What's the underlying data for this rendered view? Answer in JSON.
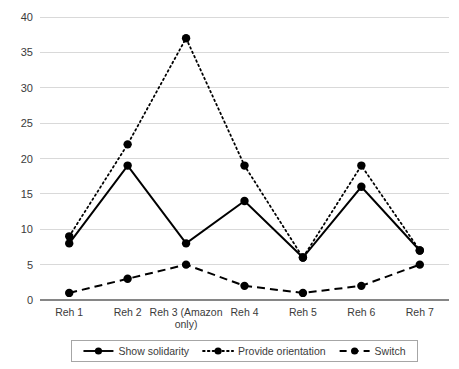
{
  "chart_data": {
    "type": "line",
    "title": "",
    "subtitle": "",
    "xlabel": "",
    "ylabel": "",
    "ylim": [
      0,
      40
    ],
    "yticks": [
      0,
      5,
      10,
      15,
      20,
      25,
      30,
      35,
      40
    ],
    "grid": "horizontal",
    "legend_position": "bottom",
    "categories": [
      "Reh 1",
      "Reh 2",
      "Reh 3 (Amazon only)",
      "Reh 4",
      "Reh 5",
      "Reh 6",
      "Reh 7"
    ],
    "category_lines": [
      [
        "Reh 1"
      ],
      [
        "Reh 2"
      ],
      [
        "Reh 3 (Amazon",
        "only)"
      ],
      [
        "Reh 4"
      ],
      [
        "Reh 5"
      ],
      [
        "Reh 6"
      ],
      [
        "Reh 7"
      ]
    ],
    "series": [
      {
        "name": "Show solidarity",
        "style": "solid",
        "color": "#000000",
        "marker": "circle",
        "values": [
          8,
          19,
          8,
          14,
          6,
          16,
          7
        ]
      },
      {
        "name": "Provide orientation",
        "style": "dotted",
        "color": "#000000",
        "marker": "circle",
        "values": [
          9,
          22,
          37,
          19,
          6,
          19,
          7
        ]
      },
      {
        "name": "Switch",
        "style": "dashed",
        "color": "#000000",
        "marker": "circle",
        "values": [
          1,
          3,
          5,
          2,
          1,
          2,
          5
        ]
      }
    ]
  },
  "axis": {
    "y_tick_labels": [
      "0",
      "5",
      "10",
      "15",
      "20",
      "25",
      "30",
      "35",
      "40"
    ]
  },
  "legend": {
    "items": [
      {
        "label": "Show solidarity",
        "style": "solid"
      },
      {
        "label": "Provide orientation",
        "style": "dotted"
      },
      {
        "label": "Switch",
        "style": "dashed"
      }
    ]
  },
  "colors": {
    "series": "#000000",
    "gridline": "#d9d9d9",
    "axis": "#868686",
    "text": "#3b3b3b",
    "background": "#ffffff"
  }
}
